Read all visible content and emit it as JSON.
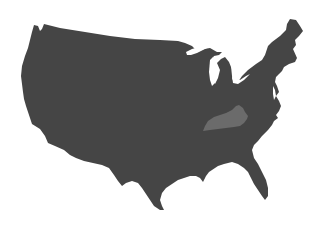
{
  "map": {
    "region": "Contiguous United States",
    "highlighted_state": "Kentucky",
    "colors": {
      "background": "#ffffff",
      "land_fill": "#454545",
      "highlight_fill": "#6b6b6b",
      "water": "#ffffff"
    }
  }
}
